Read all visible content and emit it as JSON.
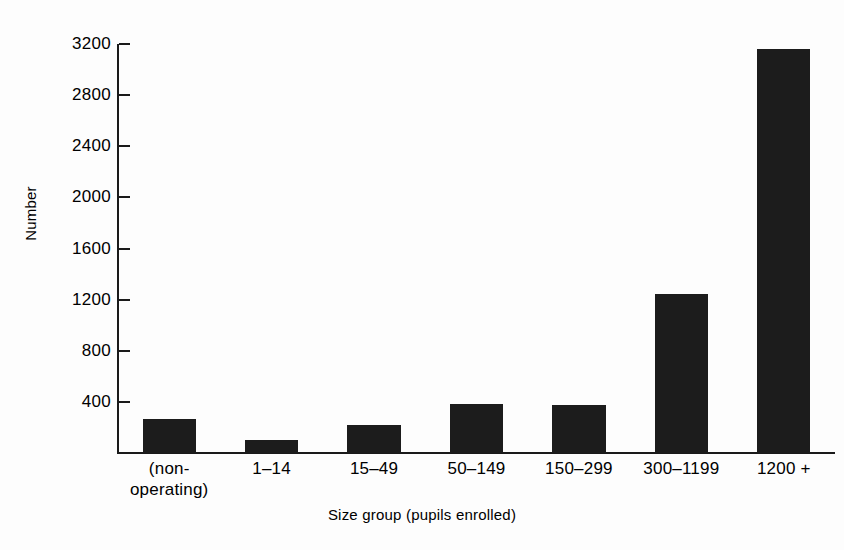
{
  "chart_data": {
    "type": "bar",
    "title": "",
    "subtitle": "",
    "xlabel": "Size group (pupils enrolled)",
    "ylabel": "Number",
    "categories": [
      "(non-\noperating)",
      "1–14",
      "15–49",
      "50–149",
      "150–299",
      "300–1199",
      "1200 +"
    ],
    "values": [
      266,
      102,
      219,
      383,
      376,
      1244,
      3161
    ],
    "ylim": [
      0,
      3200
    ],
    "yticks": [
      400,
      800,
      1200,
      1600,
      2000,
      2400,
      2800,
      3200
    ],
    "ytick_labels": [
      "400",
      "800",
      "1200",
      "1600",
      "2000",
      "2400",
      "2800",
      "3200"
    ],
    "grid": false,
    "legend": false,
    "legend_position": "none",
    "bar_color": "#1c1c1c",
    "axis_color": "#1a1a1a",
    "background_color": "#fdfdfd"
  }
}
